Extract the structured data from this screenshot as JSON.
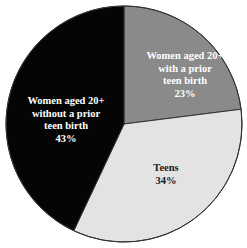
{
  "chart_data": {
    "type": "pie",
    "title": "",
    "start_angle_deg": 0,
    "direction": "clockwise",
    "slices": [
      {
        "label": "Women aged 20+ with a prior teen birth",
        "value": 23,
        "value_label": "23%",
        "color": "#8a8a8a",
        "text_color": "#ffffff",
        "label_lines": [
          "Women aged 20+",
          "with a prior",
          "teen birth",
          "23%"
        ]
      },
      {
        "label": "Teens",
        "value": 34,
        "value_label": "34%",
        "color": "#e3e3e3",
        "text_color": "#1a1a1a",
        "label_lines": [
          "Teens",
          "34%"
        ]
      },
      {
        "label": "Women aged 20+ without a prior teen birth",
        "value": 43,
        "value_label": "43%",
        "color": "#050505",
        "text_color": "#ffffff",
        "label_lines": [
          "Women aged 20+",
          "without a prior",
          "teen birth",
          "43%"
        ]
      }
    ],
    "legend": "none",
    "outline_color": "#333333"
  }
}
